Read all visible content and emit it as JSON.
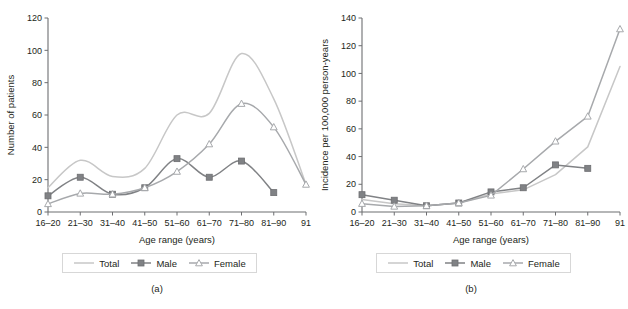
{
  "figure": {
    "panels": [
      {
        "caption": "(a)",
        "xlabel": "Age range (years)",
        "ylabel": "Number of patients"
      },
      {
        "caption": "(b)",
        "xlabel": "Age range (years)",
        "ylabel": "Incidence per 100,000 person-years"
      }
    ],
    "legend": {
      "items": [
        {
          "label": "Total",
          "marker": "none",
          "color": "#c7c7c7"
        },
        {
          "label": "Male",
          "marker": "square",
          "color": "#808285"
        },
        {
          "label": "Female",
          "marker": "triangle",
          "color": "#a7a9ac"
        }
      ]
    }
  },
  "chart_data": [
    {
      "type": "line",
      "title": "",
      "panel": "(a)",
      "xlabel": "Age range (years)",
      "ylabel": "Number of patients",
      "categories": [
        "16–20",
        "21–30",
        "31–40",
        "41–50",
        "51–60",
        "61–70",
        "71–80",
        "81–90",
        "91"
      ],
      "ylim": [
        0,
        120
      ],
      "yticks": [
        0,
        20,
        40,
        60,
        80,
        100,
        120
      ],
      "grid": false,
      "legend_position": "below",
      "smooth": true,
      "series": [
        {
          "name": "Total",
          "marker": "none",
          "color": "#c7c7c7",
          "values": [
            15,
            32,
            22,
            27,
            60,
            61,
            98,
            70,
            17
          ]
        },
        {
          "name": "Male",
          "marker": "square",
          "color": "#808285",
          "values": [
            10,
            21.5,
            11,
            15,
            33,
            21.5,
            31.5,
            12,
            null
          ]
        },
        {
          "name": "Female",
          "marker": "triangle",
          "color": "#a7a9ac",
          "values": [
            5,
            11.5,
            11,
            15,
            25,
            42,
            67,
            52.5,
            17
          ]
        }
      ]
    },
    {
      "type": "line",
      "title": "",
      "panel": "(b)",
      "xlabel": "Age range (years)",
      "ylabel": "Incidence per 100,000 person-years",
      "categories": [
        "16–20",
        "21–30",
        "31–40",
        "41–50",
        "51–60",
        "61–70",
        "71–80",
        "81–90",
        "91"
      ],
      "ylim": [
        0,
        140
      ],
      "yticks": [
        0,
        20,
        40,
        60,
        80,
        100,
        120,
        140
      ],
      "grid": false,
      "legend_position": "below",
      "smooth": false,
      "series": [
        {
          "name": "Total",
          "marker": "none",
          "color": "#c7c7c7",
          "values": [
            9,
            6,
            4.5,
            6.5,
            13,
            16,
            27,
            47,
            105
          ]
        },
        {
          "name": "Male",
          "marker": "square",
          "color": "#808285",
          "values": [
            12.5,
            8.5,
            4.5,
            6.5,
            14.5,
            17.5,
            34,
            31.5,
            null
          ]
        },
        {
          "name": "Female",
          "marker": "triangle",
          "color": "#a7a9ac",
          "values": [
            6,
            4,
            4.5,
            6.5,
            12,
            31,
            51,
            69,
            132
          ]
        }
      ]
    }
  ]
}
